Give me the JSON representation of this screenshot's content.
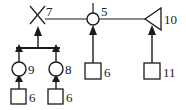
{
  "diagram": {
    "type": "petri-net-graph",
    "canvas": {
      "width": 186,
      "height": 110
    },
    "colors": {
      "background": "#ffffff",
      "stroke": "#1a1a1a",
      "node_fill": "#ffffff",
      "arrow_fill": "#1a1a1a",
      "label": "#1a1a1a"
    },
    "nodes": [
      {
        "id": "n7",
        "shape": "x-cross",
        "label": "7",
        "cx": 38,
        "cy": 15
      },
      {
        "id": "n5",
        "shape": "circle",
        "label": "5",
        "cx": 93,
        "cy": 19
      },
      {
        "id": "n10",
        "shape": "triangle-left",
        "label": "10",
        "cx": 152,
        "cy": 19
      },
      {
        "id": "n9",
        "shape": "circle",
        "label": "9",
        "cx": 19,
        "cy": 69
      },
      {
        "id": "n8",
        "shape": "circle",
        "label": "8",
        "cx": 56,
        "cy": 69
      },
      {
        "id": "s6a",
        "shape": "square",
        "label": "6",
        "cx": 19,
        "cy": 96
      },
      {
        "id": "s6b",
        "shape": "square",
        "label": "6",
        "cx": 56,
        "cy": 96
      },
      {
        "id": "s6c",
        "shape": "square",
        "label": "6",
        "cx": 93,
        "cy": 70
      },
      {
        "id": "s11",
        "shape": "square",
        "label": "11",
        "cx": 152,
        "cy": 70
      }
    ],
    "edges": [
      {
        "id": "e-7-5",
        "from": "n7",
        "to": "n5",
        "kind": "line"
      },
      {
        "id": "e-5-10",
        "from": "n5",
        "to": "n10",
        "kind": "line"
      },
      {
        "id": "e-bar-7",
        "from": "bar",
        "to": "n7",
        "kind": "arrow-up"
      },
      {
        "id": "e-9-bar",
        "from": "n9",
        "to": "bar",
        "kind": "arrow-up"
      },
      {
        "id": "e-8-bar",
        "from": "n8",
        "to": "bar",
        "kind": "arrow-up"
      },
      {
        "id": "e-6a-9",
        "from": "s6a",
        "to": "n9",
        "kind": "arrow-up"
      },
      {
        "id": "e-6b-8",
        "from": "s6b",
        "to": "n8",
        "kind": "arrow-up"
      },
      {
        "id": "e-6c-5",
        "from": "s6c",
        "to": "n5",
        "kind": "arrow-up"
      },
      {
        "id": "e-11-10",
        "from": "s11",
        "to": "n10",
        "kind": "arrow-up"
      }
    ],
    "join_bar": {
      "x1": 16,
      "x2": 60,
      "y": 48
    },
    "stub_above_n5": {
      "x": 93,
      "y1": 3,
      "y2": 12
    },
    "labels": {
      "n7": "7",
      "n5": "5",
      "n10": "10",
      "n9": "9",
      "n8": "8",
      "s6a": "6",
      "s6b": "6",
      "s6c": "6",
      "s11": "11"
    }
  }
}
